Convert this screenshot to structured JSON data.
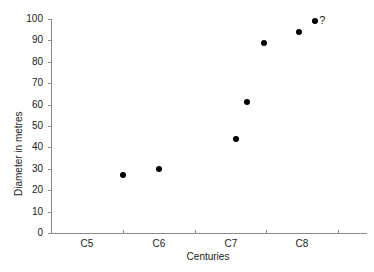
{
  "chart_data": {
    "type": "scatter",
    "title": "",
    "xlabel": "Centuries",
    "ylabel": "Diameter in metres",
    "categories": [
      "C5",
      "C6",
      "C7",
      "C8"
    ],
    "xlim": [
      4.5,
      8.9
    ],
    "ylim": [
      0,
      100
    ],
    "ytick_labels": [
      "0",
      "10",
      "20",
      "30",
      "40",
      "50",
      "60",
      "70",
      "80",
      "90",
      "100"
    ],
    "ytick_values": [
      0,
      10,
      20,
      30,
      40,
      50,
      60,
      70,
      80,
      90,
      100
    ],
    "xtick_labels": [
      "C5",
      "C6",
      "C7",
      "C8"
    ],
    "xtick_values": [
      5,
      6,
      7,
      8
    ],
    "grid": false,
    "legend": false,
    "marker_color": "#000000",
    "axis_color": "#8a8a8a",
    "series": [
      {
        "name": "Diameter",
        "points": [
          {
            "x": 5.5,
            "y": 27,
            "label": ""
          },
          {
            "x": 6.0,
            "y": 30,
            "label": ""
          },
          {
            "x": 7.07,
            "y": 44,
            "label": ""
          },
          {
            "x": 7.23,
            "y": 61,
            "label": ""
          },
          {
            "x": 7.46,
            "y": 89,
            "label": ""
          },
          {
            "x": 7.95,
            "y": 94,
            "label": ""
          },
          {
            "x": 8.18,
            "y": 99,
            "label": "?"
          }
        ]
      }
    ]
  }
}
